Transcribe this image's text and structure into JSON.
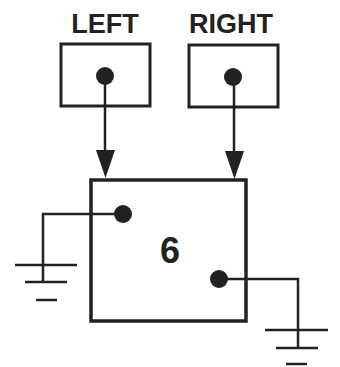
{
  "diagram": {
    "labels": {
      "left": "LEFT",
      "right": "RIGHT"
    },
    "node_value": "6",
    "nodes": [
      {
        "id": "left",
        "label": "LEFT",
        "points_to": "main"
      },
      {
        "id": "right",
        "label": "RIGHT",
        "points_to": "main"
      },
      {
        "id": "main",
        "value": "6",
        "left_child": "ground",
        "right_child": "ground"
      }
    ],
    "colors": {
      "ink": "#222222",
      "background": "#ffffff"
    }
  }
}
